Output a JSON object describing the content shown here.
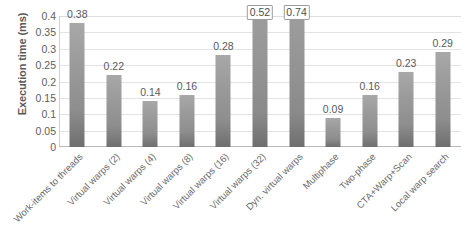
{
  "chart_data": {
    "type": "bar",
    "title": "",
    "xlabel": "",
    "ylabel": "Execution time (ms)",
    "ylim": [
      0,
      0.4
    ],
    "ytick_labels": [
      "0.4",
      "0.35",
      "0.3",
      "0.25",
      "0.2",
      "0.15",
      "0.1",
      "0.05",
      "0"
    ],
    "ytick_values": [
      0.4,
      0.35,
      0.3,
      0.25,
      0.2,
      0.15,
      0.1,
      0.05,
      0
    ],
    "grid": true,
    "legend": "none",
    "categories": [
      "Work-items to threads",
      "Virtual warps (2)",
      "Virtual warps (4)",
      "Virtual warps (8)",
      "Virtual warps (16)",
      "Virtual warps (32)",
      "Dyn. virtual warps",
      "Multiphase",
      "Two-phase",
      "CTA+Warp+Scan",
      "Local warp search"
    ],
    "values": [
      0.38,
      0.22,
      0.14,
      0.16,
      0.28,
      0.52,
      0.74,
      0.09,
      0.16,
      0.23,
      0.29
    ],
    "value_labels": [
      "0.38",
      "0.22",
      "0.14",
      "0.16",
      "0.28",
      "0.52",
      "0.74",
      "0.09",
      "0.16",
      "0.23",
      "0.29"
    ],
    "clipped_bars": [
      5,
      6
    ],
    "bar_color": "#939393",
    "grid_color": "#e3e3e3",
    "text_color": "#5a5a5c"
  }
}
